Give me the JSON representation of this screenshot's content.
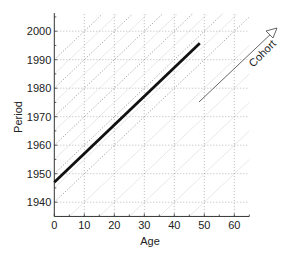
{
  "chart_data": {
    "type": "line",
    "title": "",
    "xlabel": "Age",
    "ylabel": "Period",
    "xlim": [
      0,
      65
    ],
    "ylim": [
      1935,
      2006
    ],
    "xticks": [
      0,
      10,
      20,
      30,
      40,
      50,
      60
    ],
    "yticks": [
      1940,
      1950,
      1960,
      1970,
      1980,
      1990,
      2000
    ],
    "grid": true,
    "series": [
      {
        "name": "cohort line",
        "style": "thick solid black",
        "x": [
          0,
          48.5
        ],
        "y": [
          1947,
          1995.8
        ]
      }
    ],
    "cohort_guides": {
      "style": "dotted diagonals, slope 1 (period = birth year + age)",
      "dark_birth_years": [
        1940,
        1950,
        1960,
        1970,
        1980,
        1990
      ],
      "faint_birth_years": [
        1890,
        1900,
        1910,
        1920,
        1930,
        1945,
        1955,
        1965,
        1975,
        1985
      ]
    },
    "annotations": [
      {
        "text": "Cohort",
        "type": "arrow",
        "direction": "diagonal up-right",
        "from": [
          48,
          1975
        ],
        "to": [
          74,
          2000
        ]
      }
    ],
    "legend": null
  },
  "labels": {
    "xlabel": "Age",
    "ylabel": "Period",
    "arrow_label": "Cohort",
    "xticks": [
      "0",
      "10",
      "20",
      "30",
      "40",
      "50",
      "60"
    ],
    "yticks": [
      "1940",
      "1950",
      "1960",
      "1970",
      "1980",
      "1990",
      "2000"
    ]
  },
  "colors": {
    "axis": "#333333",
    "grid": "#9a9a9a",
    "main_line": "#111111",
    "guide_dark": "#8a8a8a",
    "guide_faint": "#e2e2e2",
    "arrow": "#555555"
  }
}
